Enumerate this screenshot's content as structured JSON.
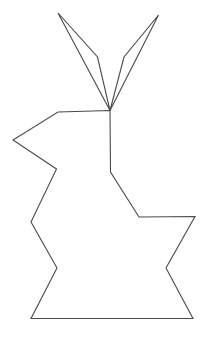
{
  "image": {
    "title": "Rabbit silhouette outline drawing",
    "subject": "rabbit",
    "style": "black line art on white background",
    "width": 213,
    "height": 340,
    "background_color": "#ffffff",
    "stroke_color": "#4a4a4a",
    "stroke_width": 1.1,
    "fill": "none"
  },
  "figure": {
    "name": "rabbit-outline",
    "parts": [
      {
        "name": "left-ear",
        "label": "Left ear",
        "points": [
          [
            110.0,
            110.5
          ],
          [
            58.0,
            13.0
          ],
          [
            97.5,
            57.0
          ],
          [
            110.0,
            110.5
          ]
        ]
      },
      {
        "name": "right-ear",
        "label": "Right ear",
        "points": [
          [
            110.0,
            110.5
          ],
          [
            158.5,
            15.0
          ],
          [
            124.0,
            57.0
          ],
          [
            110.0,
            110.5
          ]
        ]
      },
      {
        "name": "body",
        "label": "Body and head",
        "points": [
          [
            110.0,
            110.5
          ],
          [
            58.0,
            112.0
          ],
          [
            13.0,
            140.0
          ],
          [
            56.5,
            169.0
          ],
          [
            31.0,
            222.0
          ],
          [
            57.0,
            268.0
          ],
          [
            31.0,
            318.5
          ],
          [
            193.0,
            318.5
          ],
          [
            166.0,
            268.0
          ],
          [
            195.0,
            216.5
          ],
          [
            139.0,
            217.0
          ],
          [
            110.5,
            172.0
          ],
          [
            110.0,
            110.5
          ]
        ]
      }
    ],
    "vertices": {
      "ear_junction": [
        110.0,
        110.5
      ],
      "left_ear_tip": [
        58.0,
        13.0
      ],
      "left_ear_inner_bend": [
        97.5,
        57.0
      ],
      "right_ear_tip": [
        158.5,
        15.0
      ],
      "right_ear_inner_bend": [
        124.0,
        57.0
      ],
      "head_top_left": [
        58.0,
        112.0
      ],
      "nose_point_left": [
        13.0,
        140.0
      ],
      "chin_notch": [
        56.5,
        169.0
      ],
      "chest_left_point": [
        31.0,
        222.0
      ],
      "belly_notch_left": [
        57.0,
        268.0
      ],
      "bottom_left": [
        31.0,
        318.5
      ],
      "bottom_right": [
        193.0,
        318.5
      ],
      "haunch_notch_right": [
        166.0,
        268.0
      ],
      "tail_point_right": [
        195.0,
        216.5
      ],
      "back_shelf_left": [
        139.0,
        217.0
      ],
      "neck_bend": [
        110.5,
        172.0
      ]
    },
    "counts": {
      "total_vertices": 16,
      "closed_paths": 3,
      "ear_count": 2
    }
  }
}
